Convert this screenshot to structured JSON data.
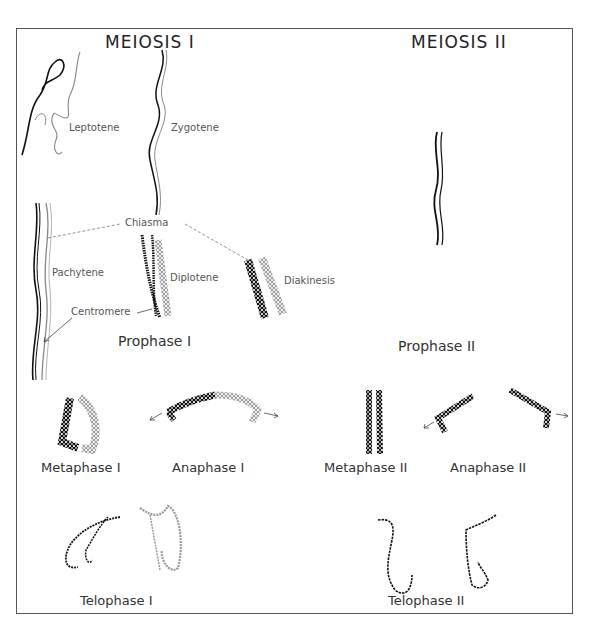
{
  "titles": {
    "meiosis1": "MEIOSIS I",
    "meiosis2": "MEIOSIS II"
  },
  "substages": {
    "leptotene": "Leptotene",
    "zygotene": "Zygotene",
    "pachytene": "Pachytene",
    "diplotene": "Diplotene",
    "diakinesis": "Diakinesis",
    "chiasma": "Chiasma",
    "centromere": "Centromere"
  },
  "phases": {
    "prophase1": "Prophase I",
    "prophase2": "Prophase II",
    "metaphase1": "Metaphase I",
    "anaphase1": "Anaphase I",
    "metaphase2": "Metaphase II",
    "anaphase2": "Anaphase II",
    "telophase1": "Telophase I",
    "telophase2": "Telophase II"
  },
  "colors": {
    "dark_chromosome": "#111111",
    "light_chromosome": "#999999",
    "frame": "#555555"
  }
}
